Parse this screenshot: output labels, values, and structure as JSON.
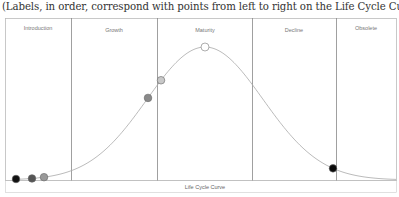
{
  "caption": "(Labels, in order, correspond with points from left to right on the Life Cycle Curve)",
  "diagram": {
    "type": "life-cycle-curve",
    "xlabel": "Life Cycle Curve",
    "phases": [
      {
        "label": "Introduction"
      },
      {
        "label": "Growth"
      },
      {
        "label": "Maturity"
      },
      {
        "label": "Decline"
      },
      {
        "label": "Obsolete"
      }
    ],
    "points": [
      {
        "phase": "Introduction",
        "fill": "#111111"
      },
      {
        "phase": "Introduction",
        "fill": "#555555"
      },
      {
        "phase": "Introduction",
        "fill": "#999999"
      },
      {
        "phase": "Growth",
        "fill": "#8a8a8a"
      },
      {
        "phase": "Maturity",
        "fill": "#c8c8c8"
      },
      {
        "phase": "Maturity",
        "fill": "#ffffff"
      },
      {
        "phase": "Decline",
        "fill": "#0a0a0a"
      }
    ]
  }
}
